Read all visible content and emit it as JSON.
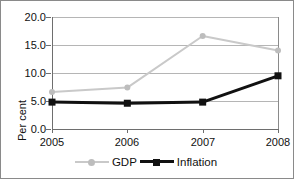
{
  "chart_data": {
    "type": "line",
    "title": "",
    "xlabel": "",
    "ylabel": "Per cent",
    "categories": [
      "2005",
      "2006",
      "2007",
      "2008"
    ],
    "x": [
      2005,
      2006,
      2007,
      2008
    ],
    "ylim": [
      0.0,
      20.0
    ],
    "yticks": [
      0.0,
      5.0,
      10.0,
      15.0,
      20.0
    ],
    "ytick_labels": [
      "0.0",
      "5.0",
      "10.0",
      "15.0",
      "20.0"
    ],
    "grid": true,
    "grid_axis": "y",
    "legend_position": "bottom",
    "series": [
      {
        "name": "GDP",
        "values": [
          6.6,
          7.4,
          16.6,
          14.0
        ],
        "color": "#c9c9c9",
        "marker": "diamond",
        "marker_color": "#bdbdbd",
        "line_width": 2
      },
      {
        "name": "Inflation",
        "values": [
          4.8,
          4.6,
          4.8,
          9.5
        ],
        "color": "#111111",
        "marker": "square",
        "marker_color": "#111111",
        "line_width": 3
      }
    ]
  },
  "axes": {
    "y_axis_title": "Per cent",
    "y_tick_labels": [
      "20.0",
      "15.0",
      "10.0",
      "5.0",
      "0.0"
    ],
    "x_tick_labels": [
      "2005",
      "2006",
      "2007",
      "2008"
    ]
  },
  "legend": {
    "items": [
      {
        "label": "GDP"
      },
      {
        "label": "Inflation"
      }
    ]
  },
  "colors": {
    "gdp_line": "#c9c9c9",
    "inflation_line": "#111111",
    "gridline": "#b5b5b5",
    "axis": "#6e6e6e",
    "border": "#8a8a8a",
    "background": "#ffffff"
  }
}
